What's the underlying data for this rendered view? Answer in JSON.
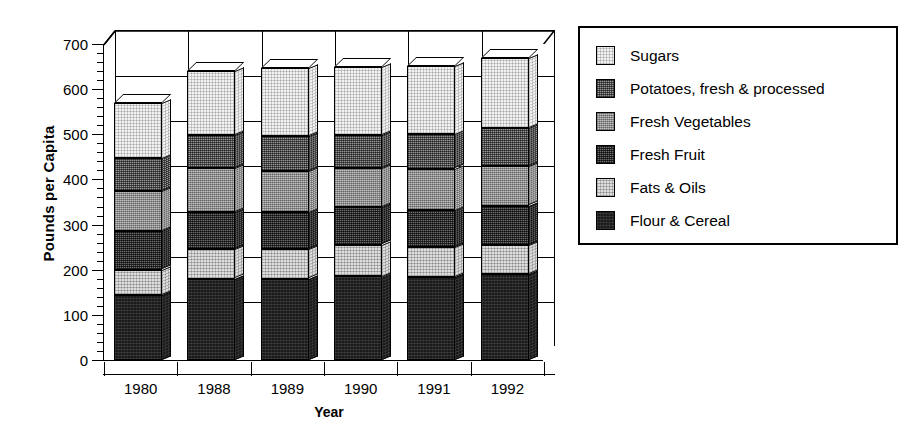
{
  "chart_data": {
    "type": "bar",
    "subtype": "stacked-3d-column",
    "title": "",
    "xlabel": "Year",
    "ylabel": "Pounds per Capita",
    "ylim": [
      0,
      700
    ],
    "ytick_step": 100,
    "yticks": [
      0,
      100,
      200,
      300,
      400,
      500,
      600,
      700
    ],
    "ytick_labels": [
      "0",
      "100",
      "200",
      "300",
      "400",
      "500",
      "600",
      "700"
    ],
    "minor_ticks": true,
    "grid": "horizontal-and-vertical",
    "legend_position": "right",
    "categories": [
      "1980",
      "1988",
      "1989",
      "1990",
      "1991",
      "1992"
    ],
    "series": [
      {
        "name": "Flour & Cereal",
        "pattern": "solid-black",
        "values": [
          145,
          180,
          180,
          185,
          183,
          190
        ]
      },
      {
        "name": "Fats & Oils",
        "pattern": "light-stipple",
        "values": [
          55,
          65,
          65,
          70,
          67,
          65
        ]
      },
      {
        "name": "Fresh Fruit",
        "pattern": "dark-checker",
        "values": [
          85,
          82,
          82,
          83,
          82,
          87
        ]
      },
      {
        "name": "Fresh Vegetables",
        "pattern": "medium-light-checker",
        "values": [
          89,
          98,
          92,
          87,
          92,
          87
        ]
      },
      {
        "name": "Potatoes, fresh & processed",
        "pattern": "medium-dark-checker",
        "values": [
          73,
          74,
          78,
          74,
          76,
          85
        ]
      },
      {
        "name": "Sugars",
        "pattern": "very-light-stipple",
        "values": [
          123,
          142,
          150,
          151,
          152,
          155
        ]
      }
    ],
    "totals": [
      570,
      641,
      647,
      650,
      652,
      669
    ]
  },
  "axes": {
    "y_title": "Pounds per Capita",
    "x_title": "Year"
  },
  "legend": {
    "items": [
      {
        "label": "Sugars"
      },
      {
        "label": "Potatoes, fresh & processed"
      },
      {
        "label": "Fresh Vegetables"
      },
      {
        "label": "Fresh Fruit"
      },
      {
        "label": "Fats & Oils"
      },
      {
        "label": "Flour & Cereal"
      }
    ]
  },
  "colors": {
    "axis": "#000000",
    "background": "#ffffff",
    "sugars": "#f2f2f2",
    "potatoes": "#9a9a9a",
    "fresh_vegetables": "#c2c2c2",
    "fresh_fruit": "#6e6e6e",
    "fats_oils": "#dedede",
    "flour_cereal": "#1a1a1a"
  }
}
